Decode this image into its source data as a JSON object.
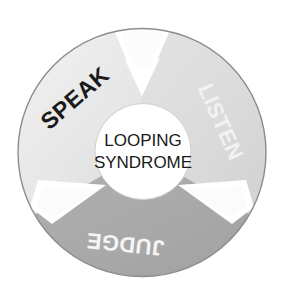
{
  "diagram": {
    "center": {
      "line1": "LOOPING",
      "line2": "SYNDROME",
      "text_color": "#1a1a1a",
      "fill": "#ffffff"
    },
    "background": "#ffffff",
    "outline_color": "#8c8c8c",
    "divider_color": "#ffffff",
    "segments": [
      {
        "id": "speak",
        "label": "SPEAK",
        "fill": "#e9e9e9",
        "text_color": "#1a1a1a",
        "order": 1
      },
      {
        "id": "listen",
        "label": "LISTEN",
        "fill": "#dcdcdc",
        "text_color": "#f2f2f2",
        "order": 2
      },
      {
        "id": "judge",
        "label": "JUDGE",
        "fill": "#a9a9a9",
        "text_color": "#f5f5f5",
        "order": 3
      }
    ]
  }
}
